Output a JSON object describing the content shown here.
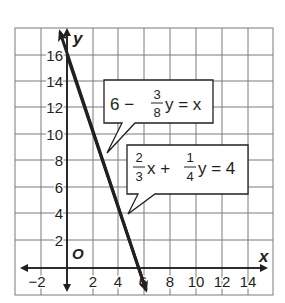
{
  "graph": {
    "x_axis": {
      "label": "x",
      "min": -3,
      "max": 16,
      "tick_labels": [
        "−2",
        "2",
        "4",
        "6",
        "8",
        "10",
        "12",
        "14"
      ],
      "tick_values": [
        -2,
        2,
        4,
        6,
        8,
        10,
        12,
        14
      ]
    },
    "y_axis": {
      "label": "y",
      "min": -2,
      "max": 18,
      "tick_labels": [
        "2",
        "4",
        "6",
        "8",
        "10",
        "12",
        "14",
        "16"
      ],
      "tick_values": [
        2,
        4,
        6,
        8,
        10,
        12,
        14,
        16
      ]
    },
    "origin_label": "O",
    "grid_step": 2,
    "colors": {
      "line": "#231f20",
      "grid": "#808080",
      "background": "#ffffff"
    },
    "lines": [
      {
        "equation": "6 − (3/8)y = x",
        "x_intercept": 6,
        "y_intercept": 16
      },
      {
        "equation": "(2/3)x + (1/4)y = 4",
        "x_intercept": 6,
        "y_intercept": 16
      }
    ],
    "callouts": [
      {
        "name": "eq1",
        "parts": {
          "a": "6 −",
          "num": "3",
          "den": "8",
          "b": "y = x"
        }
      },
      {
        "name": "eq2",
        "parts": {
          "num1": "2",
          "den1": "3",
          "a": "x +",
          "num2": "1",
          "den2": "4",
          "b": "y = 4"
        }
      }
    ]
  }
}
